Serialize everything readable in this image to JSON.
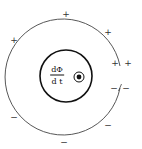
{
  "diagram": {
    "fraction": {
      "numerator": "dΦ",
      "denominator": "d t"
    },
    "field_symbol": "out-of-page (dot in circle)",
    "plus_signs": [
      {
        "label": "+",
        "x": 66,
        "y": 14
      },
      {
        "label": "+",
        "x": 108,
        "y": 32
      },
      {
        "label": "+",
        "x": 14,
        "y": 40
      },
      {
        "label": "+",
        "x": 115,
        "y": 63
      },
      {
        "label": "+",
        "x": 128,
        "y": 63
      }
    ],
    "minus_signs": [
      {
        "label": "−",
        "x": 114,
        "y": 88
      },
      {
        "label": "−",
        "x": 126,
        "y": 88
      },
      {
        "label": "−",
        "x": 14,
        "y": 117
      },
      {
        "label": "−",
        "x": 108,
        "y": 125
      },
      {
        "label": "−",
        "x": 64,
        "y": 142
      }
    ],
    "colors": {
      "line": "#333333",
      "inner_line": "#111111",
      "background": "#ffffff"
    }
  }
}
